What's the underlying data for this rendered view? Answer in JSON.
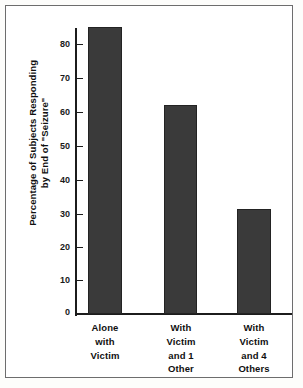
{
  "chart_data": {
    "type": "bar",
    "title": "",
    "subtitle": "",
    "xlabel": "",
    "ylabel": "Percentage of Subjects Responding by End of \"Seizure\"",
    "ylabel_lines": [
      "Percentage of Subjects Responding",
      "by End of \"Seizure\""
    ],
    "categories": [
      "Alone with Victim",
      "With Victim and 1 Other",
      "With Victim and 4 Others"
    ],
    "category_lines": [
      [
        "Alone",
        "with",
        "Victim"
      ],
      [
        "With",
        "Victim",
        "and 1",
        "Other"
      ],
      [
        "With",
        "Victim",
        "and 4",
        "Others"
      ]
    ],
    "values": [
      85,
      62,
      31
    ],
    "ylim": [
      0,
      88
    ],
    "yticks": [
      0,
      10,
      20,
      30,
      40,
      50,
      60,
      70,
      80
    ],
    "ytick_labels": [
      "0",
      "10",
      "20",
      "30",
      "40",
      "50",
      "60",
      "70",
      "80"
    ],
    "grid": false,
    "legend": null,
    "bar_color": "#3a3a3a",
    "axis_color": "#1c1c1c",
    "background": "#ffffff",
    "frame_color": "#6d6d6d"
  }
}
